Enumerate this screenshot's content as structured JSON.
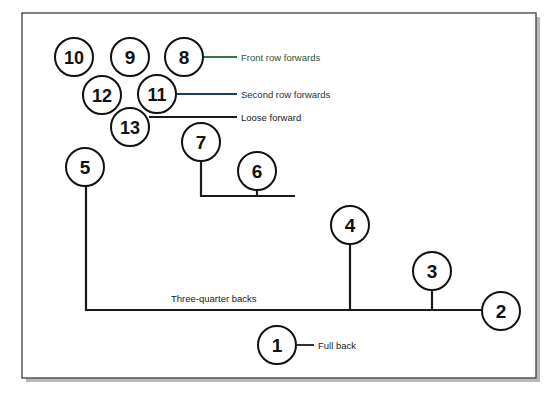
{
  "diagram": {
    "frame": {
      "x": 22,
      "y": 13,
      "width": 514,
      "height": 365,
      "border_color": "#4a4a4a",
      "background": "#ffffff",
      "shadow_color": "#b9b9b9"
    },
    "colors": {
      "circle_stroke": "#111111",
      "number_fill": "#111111",
      "line_default": "#1a1a1a",
      "front_row_accent": "#2f7d32",
      "second_row_accent": "#1d3c6e"
    },
    "players": [
      {
        "number": "10",
        "cx": 74,
        "cy": 57,
        "r": 19
      },
      {
        "number": "9",
        "cx": 130,
        "cy": 57,
        "r": 19
      },
      {
        "number": "8",
        "cx": 184,
        "cy": 57,
        "r": 19
      },
      {
        "number": "12",
        "cx": 102,
        "cy": 95,
        "r": 19
      },
      {
        "number": "11",
        "cx": 157,
        "cy": 94,
        "r": 19
      },
      {
        "number": "13",
        "cx": 130,
        "cy": 127,
        "r": 19
      },
      {
        "number": "7",
        "cx": 201,
        "cy": 142,
        "r": 19
      },
      {
        "number": "5",
        "cx": 85,
        "cy": 167,
        "r": 19
      },
      {
        "number": "6",
        "cx": 257,
        "cy": 171,
        "r": 19
      },
      {
        "number": "4",
        "cx": 350,
        "cy": 225,
        "r": 19
      },
      {
        "number": "3",
        "cx": 432,
        "cy": 271,
        "r": 19
      },
      {
        "number": "2",
        "cx": 501,
        "cy": 311,
        "r": 19
      },
      {
        "number": "1",
        "cx": 277,
        "cy": 345,
        "r": 19
      }
    ],
    "annotations": [
      {
        "id": "front-row-forwards",
        "label": "Front row forwards",
        "text_x": 241,
        "text_y": 57,
        "line_x1": 203,
        "line_y1": 57,
        "line_x2": 237,
        "line_y2": 57,
        "line_color": "#2f7d32",
        "text_color": "#2f4f30"
      },
      {
        "id": "second-row-forwards",
        "label": "Second row forwards",
        "text_x": 241,
        "text_y": 94,
        "line_x1": 176,
        "line_y1": 94,
        "line_x2": 237,
        "line_y2": 94,
        "line_color": "#1d3c6e",
        "text_color": "#23304a"
      },
      {
        "id": "loose-forward",
        "label": "Loose forward",
        "text_x": 241,
        "text_y": 117,
        "line_x1": 149,
        "line_y1": 117,
        "line_x2": 237,
        "line_y2": 117,
        "line_color": "#1a1a1a",
        "text_color": "#1a1a1a"
      },
      {
        "id": "three-quarter-backs",
        "label": "Three-quarter backs",
        "text_x": 171,
        "text_y": 298,
        "line_color": "#1a1a1a",
        "text_color": "#1a1a1a"
      },
      {
        "id": "full-back",
        "label": "Full back",
        "text_x": 318,
        "text_y": 345,
        "line_x1": 296,
        "line_y1": 345,
        "line_x2": 314,
        "line_y2": 345,
        "line_color": "#1a1a1a",
        "text_color": "#1a1a1a"
      }
    ],
    "connectors": {
      "loose_forward_group": {
        "description": "Bracket joining 7 and 6 down to a horizontal rail",
        "path": "M 201 161 L 201 196 L 295 196",
        "stem_6": "M 257 190 L 257 196"
      },
      "backs_rail": {
        "description": "Long rail from 5 down and across through 4, 3 to 2",
        "path": "M 86 186 L 86 310 L 482 310",
        "stems": [
          {
            "number": "4",
            "path": "M 350 244 L 350 310"
          },
          {
            "number": "3",
            "path": "M 432 290 L 432 310"
          }
        ]
      }
    }
  }
}
